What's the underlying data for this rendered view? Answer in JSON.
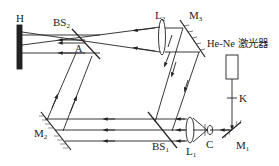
{
  "diagram": {
    "type": "holographic recording optical setup",
    "labels": {
      "hologram_plate": "H",
      "beam_splitter_2": {
        "main": "BS",
        "sub": "2"
      },
      "point_a": "A",
      "lens_2": {
        "main": "L",
        "sub": "2"
      },
      "mirror_3": {
        "main": "M",
        "sub": "3"
      },
      "laser": "He-Ne 激光器",
      "shutter": "K",
      "mirror_1": {
        "main": "M",
        "sub": "1"
      },
      "pinhole_c": "C",
      "lens_1": {
        "main": "L",
        "sub": "1"
      },
      "beam_splitter_1": {
        "main": "BS",
        "sub": "1"
      },
      "mirror_2": {
        "main": "M",
        "sub": "2"
      }
    },
    "components": [
      "H",
      "BS2",
      "A",
      "L2",
      "M3",
      "He-Ne laser",
      "K",
      "M1",
      "C",
      "L1",
      "BS1",
      "M2"
    ],
    "colors": {
      "line": "#222222",
      "background": "#ffffff"
    }
  }
}
